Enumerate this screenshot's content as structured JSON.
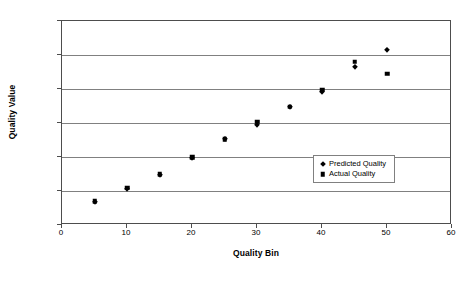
{
  "chart_data": {
    "type": "scatter",
    "title": "",
    "xlabel": "Quality Bin",
    "ylabel": "Quality Value",
    "xlim": [
      0,
      60
    ],
    "ylim": [
      0,
      60
    ],
    "xticks": [
      0,
      10,
      20,
      30,
      40,
      50,
      60
    ],
    "yticks": [
      0,
      10,
      20,
      30,
      40,
      50,
      60
    ],
    "grid": "horizontal",
    "legend_position": "inside-right-center",
    "x": [
      5,
      10,
      15,
      20,
      25,
      30,
      35,
      40,
      45,
      50
    ],
    "series": [
      {
        "name": "Predicted Quality",
        "marker": "diamond",
        "color": "#000000",
        "values": [
          6.8,
          10.6,
          14.8,
          19.8,
          25.2,
          29.5,
          34.8,
          39.0,
          46.5,
          51.5
        ]
      },
      {
        "name": "Actual Quality",
        "marker": "square",
        "color": "#000000",
        "values": [
          7.0,
          11.0,
          15.0,
          20.0,
          25.2,
          30.3,
          34.8,
          39.8,
          48.0,
          44.5
        ]
      }
    ]
  },
  "axes": {
    "y_title": "Quality Value",
    "x_title": "Quality Bin",
    "y_tick_labels": [
      "0",
      "10",
      "20",
      "30",
      "40",
      "50",
      "60"
    ],
    "x_tick_labels": [
      "0",
      "10",
      "20",
      "30",
      "40",
      "50",
      "60"
    ]
  },
  "legend": {
    "items": [
      {
        "label": "Predicted Quality",
        "marker": "diamond-marker-icon"
      },
      {
        "label": "Actual Quality",
        "marker": "square-marker-icon"
      }
    ]
  },
  "colors": {
    "marker": "#000000",
    "gridline": "#808080",
    "axis": "#4d4d4d",
    "background": "#ffffff"
  }
}
